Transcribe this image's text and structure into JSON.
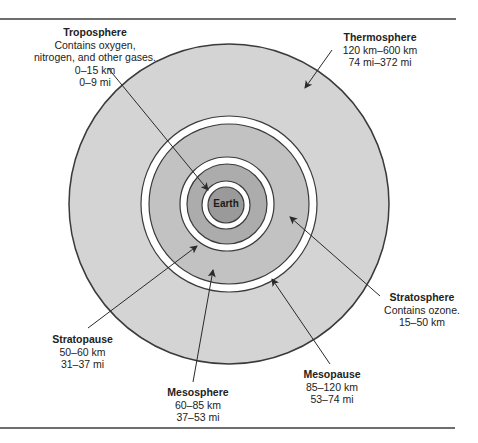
{
  "diagram": {
    "center_label": "Earth",
    "colors": {
      "thermosphere_fill": "#d4d4d4",
      "pause_ring_fill": "#ffffff",
      "mesosphere_fill": "#c4c4c4",
      "stratosphere_fill": "#b0b0b0",
      "earth_fill": "#9a9a9a",
      "outline": "#3a3a3a",
      "rule": "#6e6e6e"
    },
    "layers": [
      {
        "name": "Troposphere",
        "lines": [
          "Contains oxygen,",
          "nitrogen, and other gases.",
          "0–15 km",
          "0–9 mi"
        ]
      },
      {
        "name": "Thermosphere",
        "lines": [
          "120 km–600 km",
          "74 mi–372 mi"
        ]
      },
      {
        "name": "Stratosphere",
        "lines": [
          "Contains ozone.",
          "15–50 km"
        ]
      },
      {
        "name": "Stratopause",
        "lines": [
          "50–60 km",
          "31–37 mi"
        ]
      },
      {
        "name": "Mesosphere",
        "lines": [
          "60–85 km",
          "37–53 mi"
        ]
      },
      {
        "name": "Mesopause",
        "lines": [
          "85–120 km",
          "53–74 mi"
        ]
      }
    ]
  }
}
